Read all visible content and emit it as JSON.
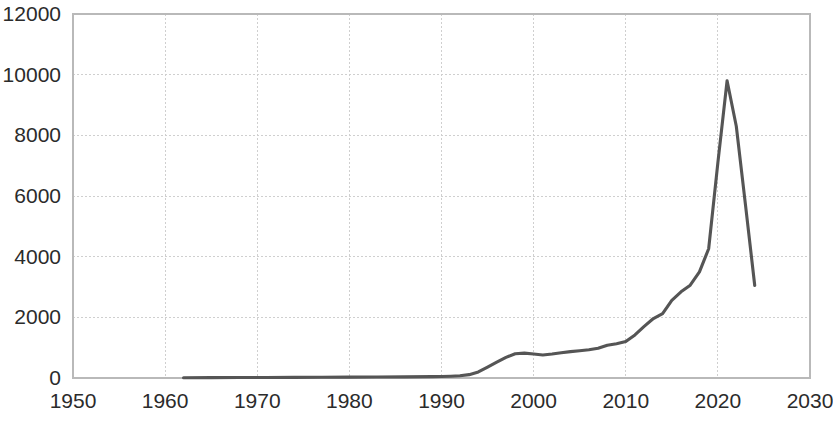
{
  "chart_data": {
    "type": "line",
    "title": "",
    "subtitle": "",
    "xlabel": "",
    "ylabel": "",
    "xlim": [
      1950,
      2030
    ],
    "ylim": [
      0,
      12000
    ],
    "x_ticks": [
      1950,
      1960,
      1970,
      1980,
      1990,
      2000,
      2010,
      2020,
      2030
    ],
    "y_ticks": [
      0,
      2000,
      4000,
      6000,
      8000,
      10000,
      12000
    ],
    "x_tick_labels": [
      "1950",
      "1960",
      "1970",
      "1980",
      "1990",
      "2000",
      "2010",
      "2020",
      "2030"
    ],
    "y_tick_labels": [
      "0",
      "2000",
      "4000",
      "6000",
      "8000",
      "10000",
      "12000"
    ],
    "grid": true,
    "legend": null,
    "legend_position": "none",
    "annotations": [],
    "line_color": "#555555",
    "grid_color": "#cfcfcf",
    "axis_color": "#b9b9b9",
    "background_color": "#ffffff",
    "series": [
      {
        "name": "value",
        "x": [
          1962,
          1965,
          1968,
          1971,
          1974,
          1977,
          1980,
          1983,
          1986,
          1989,
          1990,
          1991,
          1992,
          1993,
          1994,
          1995,
          1996,
          1997,
          1998,
          1999,
          2000,
          2001,
          2002,
          2003,
          2004,
          2005,
          2006,
          2007,
          2008,
          2009,
          2010,
          2011,
          2012,
          2013,
          2014,
          2015,
          2016,
          2017,
          2018,
          2019,
          2020,
          2021,
          2022,
          2023,
          2024
        ],
        "values": [
          10,
          12,
          15,
          18,
          20,
          24,
          28,
          32,
          38,
          45,
          50,
          60,
          75,
          110,
          200,
          360,
          520,
          680,
          800,
          820,
          790,
          760,
          790,
          830,
          870,
          900,
          930,
          980,
          1080,
          1130,
          1200,
          1420,
          1700,
          1960,
          2120,
          2560,
          2840,
          3060,
          3500,
          4260,
          7100,
          9800,
          8300,
          5700,
          3050
        ]
      }
    ]
  }
}
